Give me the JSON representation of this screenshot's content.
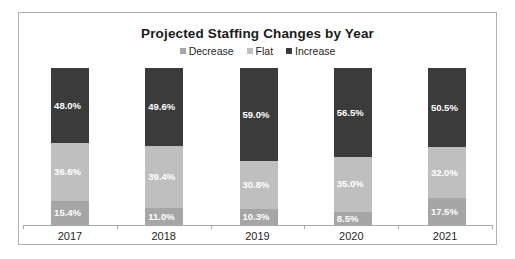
{
  "chart_data": {
    "type": "bar",
    "subtype": "stacked-column-100",
    "title": "Projected Staffing Changes by Year",
    "xlabel": "",
    "ylabel": "",
    "ylim": [
      0,
      100
    ],
    "grid": false,
    "legend_position": "top-center",
    "categories": [
      "2017",
      "2018",
      "2019",
      "2020",
      "2021"
    ],
    "series": [
      {
        "name": "Decrease",
        "color": "#a6a6a6",
        "values": [
          15.4,
          11.0,
          10.3,
          8.5,
          17.5
        ],
        "labels": [
          "15.4%",
          "11.0%",
          "10.3%",
          "8.5%",
          "17.5%"
        ]
      },
      {
        "name": "Flat",
        "color": "#bfbfbf",
        "values": [
          36.6,
          39.4,
          30.8,
          35.0,
          32.0
        ],
        "labels": [
          "36.6%",
          "39.4%",
          "30.8%",
          "35.0%",
          "32.0%"
        ]
      },
      {
        "name": "Increase",
        "color": "#3b3b3b",
        "values": [
          48.0,
          49.6,
          59.0,
          56.5,
          50.5
        ],
        "labels": [
          "48.0%",
          "49.6%",
          "59.0%",
          "56.5%",
          "50.5%"
        ]
      }
    ],
    "stack_order_bottom_to_top": [
      "Decrease",
      "Flat",
      "Increase"
    ]
  },
  "legend": {
    "items": [
      {
        "label": "Decrease",
        "color": "#a6a6a6"
      },
      {
        "label": "Flat",
        "color": "#bfbfbf"
      },
      {
        "label": "Increase",
        "color": "#3b3b3b"
      }
    ]
  },
  "colors": {
    "panel_border": "#b0b0b0",
    "axis_line": "#a9a9a9",
    "title_text": "#1a1a1a",
    "label_text": "#1f1f1f",
    "data_label_text": "#ffffff",
    "background": "#ffffff"
  }
}
